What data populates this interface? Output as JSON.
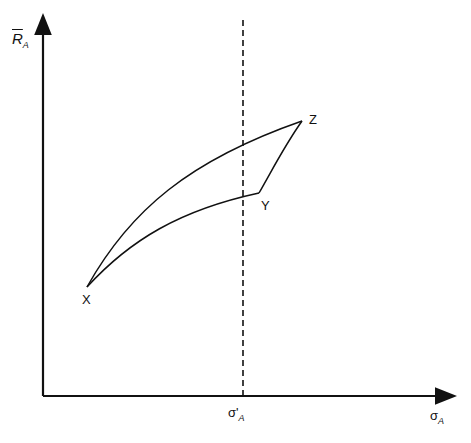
{
  "axes": {
    "y_label": "R",
    "y_label_sub": "A",
    "x_label": "σ",
    "x_label_sub": "A"
  },
  "marker": {
    "label": "σ'",
    "label_sub": "A"
  },
  "points": {
    "x": "X",
    "y": "Y",
    "z": "Z"
  },
  "colors": {
    "line": "#111111",
    "background": "#ffffff"
  }
}
